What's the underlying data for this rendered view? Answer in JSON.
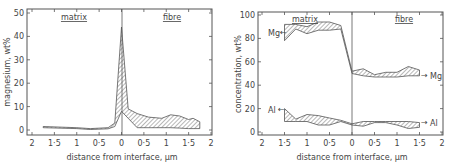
{
  "chart_data": [
    {
      "type": "area",
      "title": "",
      "xlabel": "distance from interface, µm",
      "ylabel": "magnesium, wt%",
      "xlim": [
        -2,
        2
      ],
      "ylim": [
        0,
        50
      ],
      "x_ticks": [
        -2,
        -1.5,
        -1,
        -0.5,
        0,
        0.5,
        1,
        1.5,
        2
      ],
      "x_tick_labels": [
        "2",
        "1·5",
        "1",
        "0·5",
        "0",
        "0·5",
        "1",
        "1·5",
        "2"
      ],
      "y_ticks": [
        0,
        10,
        20,
        30,
        40,
        50
      ],
      "y_tick_labels": [
        "0",
        "10",
        "20",
        "30",
        "40",
        "50"
      ],
      "region_labels": {
        "left": "matrix",
        "right": "fibre"
      },
      "interface_x": 0,
      "grid": false,
      "legend": "none",
      "series": [
        {
          "name": "Mg band",
          "x": [
            -1.75,
            -1.0,
            -0.7,
            -0.3,
            -0.15,
            0.0,
            0.15,
            0.35,
            0.6,
            0.9,
            1.1,
            1.3,
            1.5,
            1.6,
            1.75
          ],
          "upper": [
            1.5,
            1.0,
            0.6,
            1.0,
            3.0,
            44,
            9.0,
            7.0,
            5.5,
            5.0,
            6.5,
            6.0,
            4.5,
            5.0,
            3.5
          ],
          "lower": [
            1.0,
            0.6,
            0.2,
            0.5,
            1.5,
            8.0,
            5.0,
            1.0,
            1.0,
            1.0,
            1.0,
            0.8,
            0.6,
            0.6,
            0.6
          ]
        }
      ]
    },
    {
      "type": "area",
      "title": "",
      "xlabel": "distance from interface, µm",
      "ylabel": "concentration, wt%",
      "xlim": [
        -2,
        2
      ],
      "ylim": [
        0,
        100
      ],
      "x_ticks": [
        -2,
        -1.5,
        -1,
        -0.5,
        0,
        0.5,
        1,
        1.5,
        2
      ],
      "x_tick_labels": [
        "2",
        "1·5",
        "1",
        "0·5",
        "0",
        "0·5",
        "1",
        "1·5",
        "2"
      ],
      "y_ticks": [
        0,
        20,
        40,
        60,
        80,
        100
      ],
      "y_tick_labels": [
        "0",
        "20",
        "40",
        "60",
        "80",
        "100"
      ],
      "region_labels": {
        "left": "matrix",
        "right": "fibre"
      },
      "interface_x": 0,
      "grid": false,
      "legend": "inline",
      "series": [
        {
          "name": "Mg",
          "x": [
            -1.5,
            -1.25,
            -1.0,
            -0.75,
            -0.5,
            -0.25,
            0.0,
            0.25,
            0.5,
            0.75,
            1.0,
            1.25,
            1.5
          ],
          "upper": [
            92,
            92,
            90,
            94,
            94,
            91,
            52,
            54,
            49,
            51,
            51,
            56,
            53
          ],
          "lower": [
            78,
            88,
            84,
            87,
            87,
            88,
            50,
            48,
            47,
            47,
            47,
            48,
            48
          ]
        },
        {
          "name": "Al",
          "x": [
            -1.5,
            -1.25,
            -1.0,
            -0.75,
            -0.5,
            -0.25,
            0.0,
            0.25,
            0.5,
            0.75,
            1.0,
            1.25,
            1.5
          ],
          "upper": [
            20,
            11,
            15,
            14,
            12,
            10,
            7,
            9,
            9,
            9,
            9,
            9,
            8
          ],
          "lower": [
            9,
            9,
            9,
            6,
            6,
            9,
            6,
            5,
            8,
            8,
            6,
            3,
            4
          ]
        }
      ],
      "inline_labels": [
        {
          "text": "Mg",
          "side": "left"
        },
        {
          "text": "Mg",
          "side": "right"
        },
        {
          "text": "Al",
          "side": "left"
        },
        {
          "text": "Al",
          "side": "right"
        }
      ]
    }
  ],
  "panels": {
    "left": {
      "ylabel": "magnesium, wt%",
      "xlabel": "distance from interface, µm",
      "matrix": "matrix",
      "fibre": "fibre"
    },
    "right": {
      "ylabel": "concentration, wt%",
      "xlabel": "distance from interface, µm",
      "matrix": "matrix",
      "fibre": "fibre",
      "mg_left": "Mg",
      "mg_right": "Mg",
      "al_left": "Al",
      "al_right": "Al"
    }
  },
  "colors": {
    "axis": "#555555",
    "hatch": "#777777",
    "line": "#555555",
    "background": "#ffffff"
  }
}
